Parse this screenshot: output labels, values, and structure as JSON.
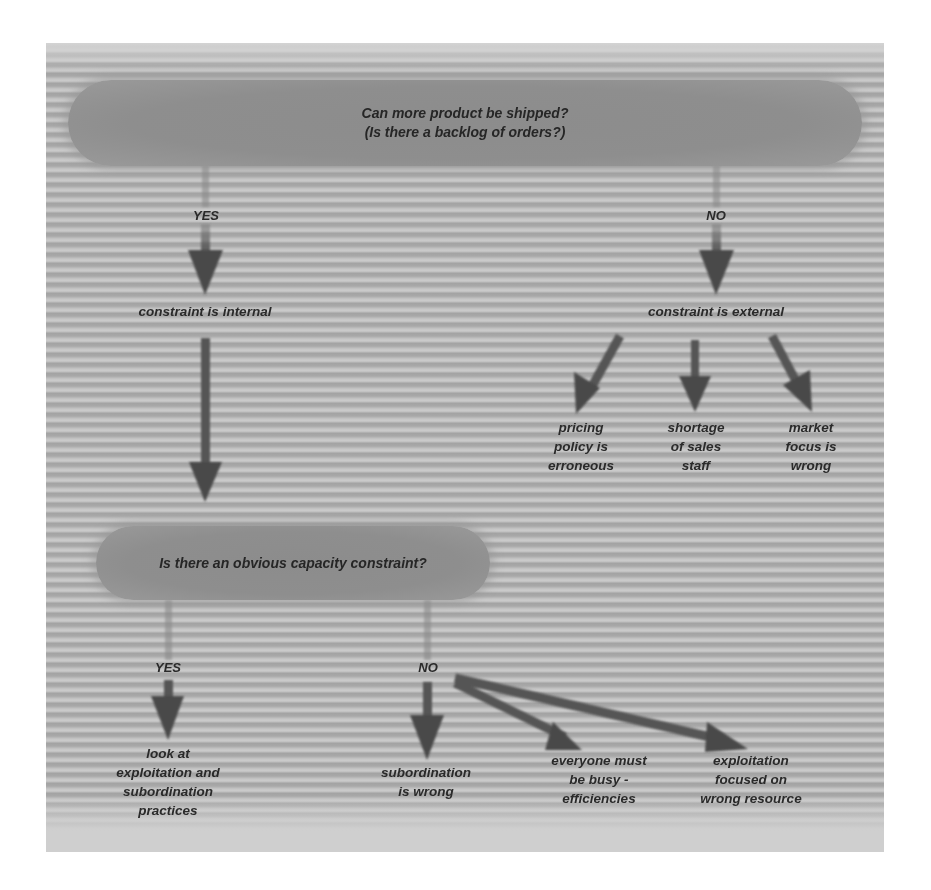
{
  "diagram": {
    "type": "decision-flowchart",
    "colors": {
      "background": "#ffffff",
      "panel_stripe_dark": "#a5a5a5",
      "panel_stripe_light": "#c9c9c9",
      "pill_fill": "#8e8e8e",
      "arrow": "#4a4a4a",
      "text": "#262626"
    },
    "top_question": {
      "text": "Can more product be shipped?\n(Is there a backlog of orders?)"
    },
    "top_branches": {
      "yes_label": "YES",
      "no_label": "NO"
    },
    "internal": {
      "text": "constraint is internal"
    },
    "external": {
      "text": "constraint is external",
      "causes": [
        {
          "text": "pricing\npolicy is\nerroneous"
        },
        {
          "text": "shortage\nof sales\nstaff"
        },
        {
          "text": "market\nfocus is\nwrong"
        }
      ]
    },
    "capacity_question": {
      "text": "Is there an obvious capacity constraint?"
    },
    "capacity_branches": {
      "yes_label": "YES",
      "no_label": "NO"
    },
    "capacity_yes_outcome": {
      "text": "look at\nexploitation and\nsubordination\npractices"
    },
    "capacity_no_outcomes": [
      {
        "text": "subordination\nis wrong"
      },
      {
        "text": "everyone must\nbe busy -\nefficiencies"
      },
      {
        "text": "exploitation\nfocused on\nwrong resource"
      }
    ]
  }
}
